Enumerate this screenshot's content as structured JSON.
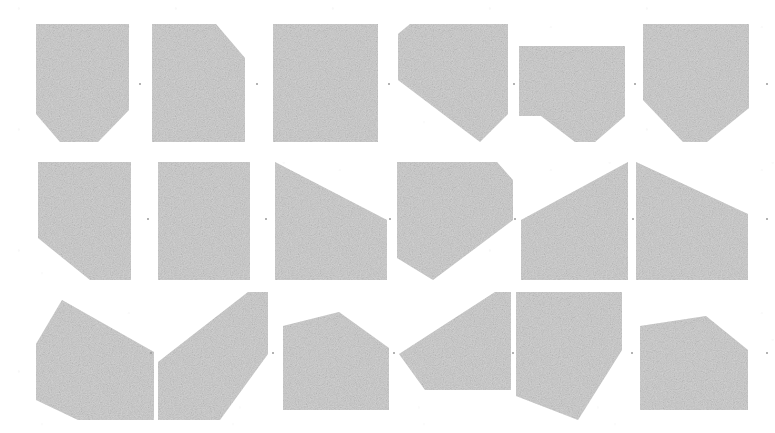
{
  "figure": {
    "title": "Grid of grey polygonal tiles",
    "type": "polygon-tile-grid",
    "rows": 3,
    "columns": 6,
    "canvas": {
      "width": 775,
      "height": 433
    },
    "background_color": "#ffffff",
    "shape_fill_color": "#c9c9c9",
    "shape_texture": "grainy-halftone",
    "separator_dot_color": "#9a9a9a"
  },
  "tiles": [
    {
      "id": "tile-r1c1",
      "row": 1,
      "column": 1,
      "name": "pentagon-point-down-left",
      "label": "",
      "box": {
        "x": 36,
        "y": 24,
        "width": 93,
        "height": 118
      },
      "points": "0,0 93,0 93,86 62,118 24,118 0,90"
    },
    {
      "id": "tile-r1c2",
      "row": 1,
      "column": 2,
      "name": "quadrilateral-curved-top-right",
      "label": "",
      "box": {
        "x": 152,
        "y": 24,
        "width": 93,
        "height": 118
      },
      "points": "0,0 64,0 93,34 93,118 0,118"
    },
    {
      "id": "tile-r1c3",
      "row": 1,
      "column": 3,
      "name": "rectangle-full",
      "label": "",
      "box": {
        "x": 273,
        "y": 24,
        "width": 105,
        "height": 118
      },
      "points": "0,0 105,0 105,118 0,118"
    },
    {
      "id": "tile-r1c4",
      "row": 1,
      "column": 4,
      "name": "pentagon-point-down-right",
      "label": "",
      "box": {
        "x": 398,
        "y": 24,
        "width": 110,
        "height": 118
      },
      "points": "12,0 110,0 110,90 82,118 0,56 0,10"
    },
    {
      "id": "tile-r1c5",
      "row": 1,
      "column": 5,
      "name": "pentagon-notch-bottom-center",
      "label": "",
      "box": {
        "x": 519,
        "y": 46,
        "width": 106,
        "height": 96
      },
      "points": "0,0 106,0 106,70 76,96 56,96 22,70 0,70"
    },
    {
      "id": "tile-r1c6",
      "row": 1,
      "column": 6,
      "name": "pentagon-point-down-center",
      "label": "",
      "box": {
        "x": 643,
        "y": 24,
        "width": 106,
        "height": 118
      },
      "points": "0,0 106,0 106,84 64,118 40,118 0,76"
    },
    {
      "id": "tile-r2c1",
      "row": 2,
      "column": 1,
      "name": "pentagon-clipped-bottom-left",
      "label": "",
      "box": {
        "x": 38,
        "y": 162,
        "width": 93,
        "height": 118
      },
      "points": "0,0 93,0 93,118 52,118 0,76"
    },
    {
      "id": "tile-r2c2",
      "row": 2,
      "column": 2,
      "name": "rectangle-split-vertical",
      "label": "",
      "box": {
        "x": 158,
        "y": 162,
        "width": 92,
        "height": 118
      },
      "points": "0,0 92,0 92,118 0,118"
    },
    {
      "id": "tile-r2c3",
      "row": 2,
      "column": 3,
      "name": "trapezoid-descending-right",
      "label": "",
      "box": {
        "x": 275,
        "y": 162,
        "width": 112,
        "height": 118
      },
      "points": "0,0 112,58 112,118 0,118"
    },
    {
      "id": "tile-r2c4",
      "row": 2,
      "column": 4,
      "name": "parallelogram-descending",
      "label": "",
      "box": {
        "x": 397,
        "y": 162,
        "width": 116,
        "height": 118
      },
      "points": "0,0 100,0 116,18 116,58 36,118 0,96"
    },
    {
      "id": "tile-r2c5",
      "row": 2,
      "column": 5,
      "name": "triangle-rising-right",
      "label": "",
      "box": {
        "x": 521,
        "y": 162,
        "width": 107,
        "height": 118
      },
      "points": "107,0 107,118 0,118 0,58"
    },
    {
      "id": "tile-r2c6",
      "row": 2,
      "column": 6,
      "name": "trapezoid-peak-left",
      "label": "",
      "box": {
        "x": 636,
        "y": 162,
        "width": 112,
        "height": 118
      },
      "points": "0,0 112,52 112,118 0,118"
    },
    {
      "id": "tile-r3c1",
      "row": 3,
      "column": 1,
      "name": "quadrilateral-slanted-right-edge",
      "label": "",
      "box": {
        "x": 36,
        "y": 300,
        "width": 118,
        "height": 120
      },
      "points": "26,0 118,52 118,120 42,120 0,100 0,44"
    },
    {
      "id": "tile-r3c2",
      "row": 3,
      "column": 2,
      "name": "parallelogram-steep-rising",
      "label": "",
      "box": {
        "x": 158,
        "y": 292,
        "width": 110,
        "height": 128
      },
      "points": "90,0 110,0 110,62 62,128 0,128 0,70"
    },
    {
      "id": "tile-r3c3",
      "row": 3,
      "column": 3,
      "name": "pentagon-peaked-top",
      "label": "",
      "box": {
        "x": 283,
        "y": 312,
        "width": 106,
        "height": 98
      },
      "points": "0,14 56,0 106,36 106,98 0,98"
    },
    {
      "id": "tile-r3c4",
      "row": 3,
      "column": 4,
      "name": "quadrilateral-rising-right",
      "label": "",
      "box": {
        "x": 399,
        "y": 292,
        "width": 112,
        "height": 128
      },
      "points": "96,0 112,0 112,98 26,98 0,62"
    },
    {
      "id": "tile-r3c5",
      "row": 3,
      "column": 5,
      "name": "quadrilateral-tapered-down-right",
      "label": "",
      "box": {
        "x": 516,
        "y": 292,
        "width": 106,
        "height": 128
      },
      "points": "0,0 106,0 106,58 62,128 0,104"
    },
    {
      "id": "tile-r3c6",
      "row": 3,
      "column": 6,
      "name": "quadrilateral-angled-top",
      "label": "",
      "box": {
        "x": 640,
        "y": 316,
        "width": 108,
        "height": 94
      },
      "points": "0,10 66,0 108,34 108,94 0,94"
    }
  ],
  "separator_dots": [
    {
      "id": "dot-r1-1",
      "x": 139,
      "y": 83
    },
    {
      "id": "dot-r1-2",
      "x": 256,
      "y": 83
    },
    {
      "id": "dot-r1-3",
      "x": 388,
      "y": 83
    },
    {
      "id": "dot-r1-4",
      "x": 513,
      "y": 83
    },
    {
      "id": "dot-r1-5",
      "x": 634,
      "y": 83
    },
    {
      "id": "dot-r1-6",
      "x": 766,
      "y": 83
    },
    {
      "id": "dot-r2-1",
      "x": 147,
      "y": 218
    },
    {
      "id": "dot-r2-2",
      "x": 265,
      "y": 218
    },
    {
      "id": "dot-r2-3",
      "x": 389,
      "y": 218
    },
    {
      "id": "dot-r2-4",
      "x": 514,
      "y": 218
    },
    {
      "id": "dot-r2-5",
      "x": 632,
      "y": 218
    },
    {
      "id": "dot-r2-6",
      "x": 766,
      "y": 218
    },
    {
      "id": "dot-r3-1",
      "x": 150,
      "y": 352
    },
    {
      "id": "dot-r3-2",
      "x": 272,
      "y": 352
    },
    {
      "id": "dot-r3-3",
      "x": 393,
      "y": 352
    },
    {
      "id": "dot-r3-4",
      "x": 512,
      "y": 352
    },
    {
      "id": "dot-r3-5",
      "x": 631,
      "y": 352
    },
    {
      "id": "dot-r3-6",
      "x": 766,
      "y": 352
    }
  ]
}
